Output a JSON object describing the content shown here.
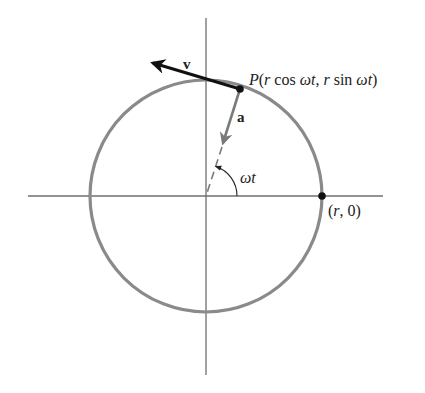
{
  "diagram": {
    "colors": {
      "circle": "#8a8a8a",
      "axis": "#777777",
      "velocity": "#111111",
      "acceleration": "#7a7a7a",
      "point": "#111111",
      "text": "#222222"
    },
    "geometry": {
      "center": [
        206,
        196
      ],
      "radius": 116,
      "point_P": [
        240,
        89
      ],
      "point_r0": [
        322,
        196
      ],
      "velocity_tip": [
        149,
        62
      ],
      "acceleration_tip": [
        222,
        146
      ]
    },
    "labels": {
      "velocity": "v",
      "acceleration": "a",
      "point_P": "P(r cos ωt, r sin ωt)",
      "point_P_parts": {
        "P": "P",
        "open": "(",
        "r1": "r",
        "cos": " cos ",
        "wt1": "ωt",
        "comma": ", ",
        "r2": "r",
        "sin": " sin ",
        "wt2": "ωt",
        "close": ")"
      },
      "angle": "ωt",
      "point_r0": "(r, 0)",
      "point_r0_parts": {
        "open": "(",
        "r": "r",
        "rest": ", 0)"
      }
    }
  }
}
